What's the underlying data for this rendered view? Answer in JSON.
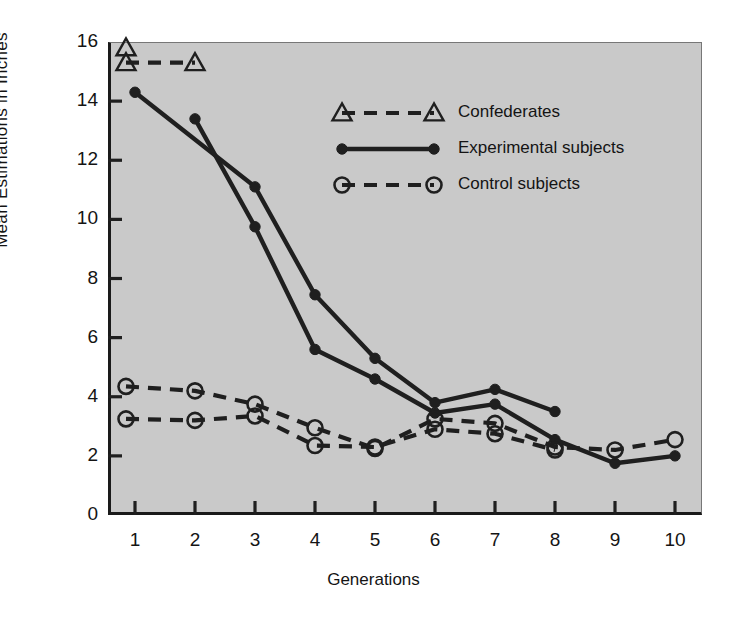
{
  "chart_data": {
    "type": "line",
    "title": "",
    "xlabel": "Generations",
    "ylabel": "Mean Estimations in Inches",
    "xlim": [
      0.55,
      10.45
    ],
    "ylim": [
      0,
      16
    ],
    "xticks": [
      1,
      2,
      3,
      4,
      5,
      6,
      7,
      8,
      9,
      10
    ],
    "yticks": [
      0,
      2,
      4,
      6,
      8,
      10,
      12,
      14,
      16
    ],
    "xticklabels": [
      "1",
      "2",
      "3",
      "4",
      "5",
      "6",
      "7",
      "8",
      "9",
      "10"
    ],
    "yticklabels": [
      "0",
      "2",
      "4",
      "6",
      "8",
      "10",
      "12",
      "14",
      "16"
    ],
    "grid": false,
    "legend_position": "upper-center-right",
    "plot_background": "#c9c9c9",
    "line_color": "#1f1f1f",
    "series": [
      {
        "name": "Confederates",
        "marker": "open-triangle",
        "linestyle": "dashed",
        "x": [
          0.85,
          2
        ],
        "values": [
          15.3,
          15.3
        ]
      },
      {
        "name": "Confederates",
        "marker": "open-triangle",
        "linestyle": "none",
        "x": [
          0.85
        ],
        "values": [
          15.8
        ]
      },
      {
        "name": "Experimental subjects",
        "marker": "filled-circle",
        "linestyle": "solid",
        "x": [
          1,
          3,
          4,
          5,
          6,
          7,
          8
        ],
        "values": [
          14.3,
          11.1,
          7.45,
          5.3,
          3.8,
          4.25,
          3.5
        ]
      },
      {
        "name": "Experimental subjects",
        "marker": "filled-circle",
        "linestyle": "solid",
        "x": [
          2,
          3,
          4,
          5,
          6,
          7,
          8,
          9,
          10
        ],
        "values": [
          13.4,
          9.75,
          5.6,
          4.6,
          3.45,
          3.75,
          2.55,
          1.75,
          2.0
        ]
      },
      {
        "name": "Control subjects",
        "marker": "open-circle",
        "linestyle": "dashed",
        "x": [
          0.85,
          2,
          3,
          4,
          5,
          6,
          7,
          8,
          9,
          10
        ],
        "values": [
          4.35,
          4.2,
          3.75,
          2.95,
          2.25,
          3.25,
          3.1,
          2.3,
          2.2,
          2.55
        ]
      },
      {
        "name": "Control subjects",
        "marker": "open-circle",
        "linestyle": "dashed",
        "x": [
          0.85,
          2,
          3,
          4,
          5,
          6,
          7,
          8
        ],
        "values": [
          3.25,
          3.2,
          3.35,
          2.35,
          2.3,
          2.9,
          2.75,
          2.2
        ]
      }
    ]
  },
  "legend": {
    "items": [
      {
        "label": "Confederates",
        "marker": "open-triangle",
        "linestyle": "dashed"
      },
      {
        "label": "Experimental subjects",
        "marker": "filled-circle",
        "linestyle": "solid"
      },
      {
        "label": "Control subjects",
        "marker": "open-circle",
        "linestyle": "dashed"
      }
    ]
  }
}
